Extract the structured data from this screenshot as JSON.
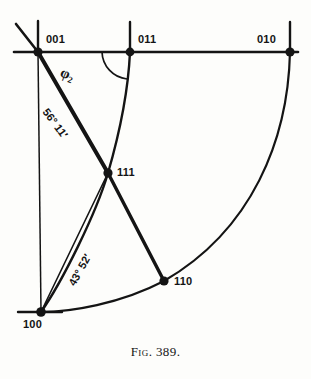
{
  "figure": {
    "caption_prefix": "Fig.",
    "caption_number": "389.",
    "caption_full": "FIG. 389."
  },
  "diagram": {
    "type": "stereographic-projection",
    "ink_color": "#141414",
    "background_color": "#fdfdfb"
  },
  "poles": [
    {
      "id": "001",
      "label": "001",
      "x": 38,
      "y": 52,
      "label_x": 46,
      "label_y": 34
    },
    {
      "id": "011",
      "label": "011",
      "x": 130,
      "y": 52,
      "label_x": 138,
      "label_y": 34
    },
    {
      "id": "010",
      "label": "010",
      "x": 290,
      "y": 52,
      "label_x": 258,
      "label_y": 34
    },
    {
      "id": "111",
      "label": "111",
      "x": 108,
      "y": 173,
      "label_x": 117,
      "label_y": 165
    },
    {
      "id": "110",
      "label": "110",
      "x": 164,
      "y": 281,
      "label_x": 174,
      "label_y": 274
    },
    {
      "id": "100",
      "label": "100",
      "x": 41,
      "y": 312,
      "label_x": 24,
      "label_y": 318
    }
  ],
  "angles": [
    {
      "id": "phi2",
      "text": "φ",
      "subscript": "2",
      "between": "001-011 horizontal and 011-111 arc",
      "label_x": 64,
      "label_y": 66,
      "rotation": 22
    },
    {
      "id": "angle-001-111",
      "text": "56° 11′",
      "value_degrees": 56,
      "value_minutes": 11,
      "between": "001 and 111",
      "label_x": 50,
      "label_y": 108,
      "rotation": 53
    },
    {
      "id": "angle-100-111",
      "text": "43° 52′",
      "value_degrees": 43,
      "value_minutes": 52,
      "between": "100 and 111",
      "label_x": 66,
      "label_y": 282,
      "rotation": -61
    }
  ]
}
